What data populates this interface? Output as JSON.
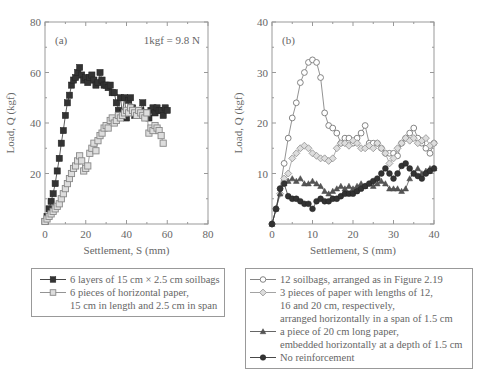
{
  "chart_data": [
    {
      "id": "a",
      "type": "line",
      "panel_label": "(a)",
      "annotation": "1kgf = 9.8 N",
      "xlabel": "Settlement, S (mm)",
      "ylabel": "Load, Q (kgf)",
      "xlim": [
        0,
        80
      ],
      "ylim": [
        0,
        80
      ],
      "xticks": [
        0,
        20,
        40,
        60,
        80
      ],
      "yticks": [
        20,
        40,
        60,
        80
      ],
      "grid": false,
      "legend_position": "below",
      "series": [
        {
          "name": "6 layers of 15 cm × 2.5 cm soilbags",
          "marker": "filled-square",
          "color": "#333333",
          "x": [
            0,
            1,
            2,
            3,
            4,
            5,
            6,
            7,
            8,
            9,
            10,
            11,
            12,
            13,
            14,
            15,
            16,
            17,
            18,
            19,
            20,
            21,
            22,
            23,
            24,
            25,
            26,
            27,
            28,
            29,
            30,
            31,
            32,
            33,
            34,
            35,
            36,
            37,
            38,
            39,
            40,
            41,
            42,
            43,
            44,
            45,
            46,
            47,
            48,
            49,
            50,
            51,
            52,
            53,
            54,
            55,
            56,
            57,
            58,
            59,
            60
          ],
          "y": [
            1,
            3,
            6,
            9,
            12,
            16,
            21,
            26,
            32,
            37,
            43,
            48,
            51,
            55,
            57,
            58,
            60,
            62,
            59,
            57,
            58,
            56,
            58,
            59,
            57,
            55,
            56,
            60,
            57,
            55,
            55,
            54,
            55,
            52,
            52,
            48,
            45,
            50,
            44,
            50,
            42,
            49,
            50,
            46,
            43,
            45,
            44,
            45,
            48,
            43,
            44,
            42,
            45,
            46,
            44,
            46,
            45,
            45,
            43,
            46,
            45
          ]
        },
        {
          "name": "6 pieces of horizontal paper, 15 cm in length and 2.5 cm in span",
          "marker": "dotted-square",
          "color": "#888888",
          "x": [
            0,
            1,
            2,
            3,
            4,
            5,
            6,
            7,
            8,
            9,
            10,
            11,
            12,
            13,
            14,
            15,
            16,
            17,
            18,
            19,
            20,
            21,
            22,
            23,
            24,
            25,
            26,
            27,
            28,
            29,
            30,
            31,
            32,
            33,
            34,
            35,
            36,
            37,
            38,
            39,
            40,
            41,
            42,
            43,
            44,
            45,
            46,
            47,
            48,
            49,
            50,
            51,
            52,
            53,
            54,
            55,
            56,
            57,
            58
          ],
          "y": [
            1,
            2,
            3,
            4,
            5,
            6,
            7,
            8,
            10,
            12,
            14,
            16,
            18,
            20,
            22,
            23,
            25,
            27,
            25,
            21,
            22,
            23,
            28,
            30,
            32,
            29,
            33,
            35,
            36,
            38,
            39,
            38,
            41,
            42,
            40,
            41,
            43,
            42,
            43,
            44,
            45,
            44,
            46,
            45,
            44,
            43,
            45,
            44,
            43,
            42,
            44,
            36,
            38,
            37,
            39,
            38,
            37,
            35,
            32
          ]
        }
      ]
    },
    {
      "id": "b",
      "type": "line",
      "panel_label": "(b)",
      "xlabel": "Settlement, S (mm)",
      "ylabel": "Load, Q (kgf)",
      "xlim": [
        0,
        40
      ],
      "ylim": [
        0,
        40
      ],
      "xticks": [
        0,
        10,
        20,
        30,
        40
      ],
      "yticks": [
        10,
        20,
        30,
        40
      ],
      "grid": false,
      "legend_position": "below",
      "series": [
        {
          "name": "12 soilbags, arranged as in Figure 2.19",
          "marker": "open-circle",
          "color": "#777777",
          "x": [
            0,
            1,
            2,
            3,
            4,
            5,
            6,
            7,
            8,
            9,
            10,
            11,
            12,
            13,
            14,
            15,
            16,
            17,
            18,
            19,
            20,
            21,
            22,
            23,
            24,
            25,
            26,
            27,
            28,
            29,
            30,
            31,
            32,
            33,
            34,
            35,
            36,
            37,
            38,
            39,
            40
          ],
          "y": [
            0,
            3,
            7,
            12,
            17,
            21,
            24,
            28,
            30,
            32,
            32.5,
            32,
            29,
            22,
            19.5,
            19,
            18,
            16,
            17,
            17,
            16,
            17,
            18,
            19.5,
            16,
            16,
            16,
            15,
            14,
            14,
            14,
            13.5,
            16,
            17,
            18,
            19,
            17,
            16,
            15,
            14,
            16
          ]
        },
        {
          "name": "3 pieces of paper with lengths of 12, 16 and 20 cm, respectively, arranged horizontally in a span of 1.5 cm",
          "marker": "dotted-diamond",
          "color": "#999999",
          "x": [
            0,
            1,
            2,
            3,
            4,
            5,
            6,
            7,
            8,
            9,
            10,
            11,
            12,
            13,
            14,
            15,
            16,
            17,
            18,
            19,
            20,
            21,
            22,
            23,
            24,
            25,
            26,
            27,
            28,
            29,
            30,
            31,
            32,
            33,
            34,
            35,
            36,
            37,
            38,
            39,
            40
          ],
          "y": [
            0,
            3,
            6,
            9,
            10,
            13,
            14,
            15,
            15.5,
            15,
            14,
            13.5,
            13,
            13,
            12.5,
            13,
            15,
            16,
            16,
            15.5,
            16.5,
            16,
            15,
            15,
            15.5,
            15,
            16,
            15,
            14,
            12,
            13,
            15,
            16,
            17,
            16.5,
            17,
            16,
            16.5,
            17,
            15.5,
            16
          ]
        },
        {
          "name": "a piece of 20 cm long paper, embedded horizontally at a depth of 1.5 cm",
          "marker": "filled-triangle",
          "color": "#555555",
          "x": [
            0,
            1,
            2,
            3,
            4,
            5,
            6,
            7,
            8,
            9,
            10,
            11,
            12,
            13,
            14,
            15,
            16,
            17,
            18,
            19,
            20,
            21,
            22,
            23,
            24,
            25,
            26,
            27,
            28,
            29,
            30,
            31,
            32,
            33,
            34,
            35,
            36,
            37,
            38,
            39,
            40
          ],
          "y": [
            0,
            3,
            6,
            8,
            8.5,
            9,
            8.5,
            9,
            8,
            8,
            8.5,
            8,
            7.5,
            6.5,
            6,
            6.5,
            7,
            7.5,
            7,
            7.5,
            7,
            7.5,
            8,
            7.5,
            8,
            7.5,
            8,
            8.5,
            8,
            7,
            7,
            7,
            6.5,
            7,
            9,
            10,
            11,
            10,
            10.5,
            11,
            11
          ]
        },
        {
          "name": "No reinforcement",
          "marker": "filled-circle",
          "color": "#333333",
          "x": [
            0,
            1,
            2,
            3,
            4,
            5,
            6,
            7,
            8,
            9,
            10,
            11,
            12,
            13,
            14,
            15,
            16,
            17,
            18,
            19,
            20,
            21,
            22,
            23,
            24,
            25,
            26,
            27,
            28,
            29,
            30,
            31,
            32,
            33,
            34,
            35,
            36,
            37,
            38,
            39,
            40
          ],
          "y": [
            0,
            3,
            7,
            8,
            5.5,
            5,
            5,
            4.5,
            4,
            4,
            3,
            4.5,
            5,
            4.5,
            4.5,
            5,
            5,
            5.5,
            6,
            6,
            6,
            6.5,
            7,
            7.5,
            8,
            8.5,
            9,
            10,
            11,
            10,
            9,
            10,
            11.5,
            12,
            11,
            10,
            9.5,
            9,
            10,
            10.5,
            11
          ]
        }
      ]
    }
  ],
  "legend_a": {
    "entries": [
      {
        "symbol": "filled-square",
        "lines": [
          "6 layers of 15 cm × 2.5 cm soilbags"
        ]
      },
      {
        "symbol": "dotted-square",
        "lines": [
          "6 pieces of horizontal paper,",
          "15 cm in length and 2.5 cm in span"
        ]
      }
    ]
  },
  "legend_b": {
    "entries": [
      {
        "symbol": "open-circle",
        "lines": [
          "12 soilbags, arranged as in Figure 2.19"
        ]
      },
      {
        "symbol": "dotted-diamond",
        "lines": [
          "3 pieces of paper with lengths of 12,",
          "16 and 20 cm, respectively,",
          "arranged horizontally in a span of 1.5 cm"
        ]
      },
      {
        "symbol": "filled-triangle",
        "lines": [
          "a piece of 20 cm long paper,",
          "embedded horizontally at a depth of 1.5 cm"
        ]
      },
      {
        "symbol": "filled-circle",
        "lines": [
          "No reinforcement"
        ]
      }
    ]
  }
}
